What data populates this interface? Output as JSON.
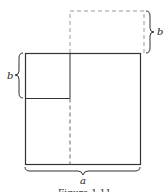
{
  "diagram": {
    "labels": {
      "b_top_right": "b",
      "b_left": "b",
      "a_bottom": "a"
    },
    "caption": "Figure 1.11",
    "colors": {
      "stroke": "#333333",
      "dashed": "#999999"
    }
  }
}
